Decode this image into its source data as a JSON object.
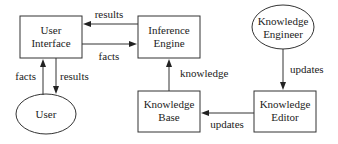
{
  "diagram": {
    "type": "flowchart",
    "nodes": {
      "user_interface": {
        "label_line1": "User",
        "label_line2": "Interface",
        "shape": "rectangle"
      },
      "inference_engine": {
        "label_line1": "Inference",
        "label_line2": "Engine",
        "shape": "rectangle"
      },
      "knowledge_engineer": {
        "label_line1": "Knowledge",
        "label_line2": "Engineer",
        "shape": "ellipse"
      },
      "user": {
        "label": "User",
        "shape": "ellipse"
      },
      "knowledge_base": {
        "label_line1": "Knowledge",
        "label_line2": "Base",
        "shape": "rectangle"
      },
      "knowledge_editor": {
        "label_line1": "Knowledge",
        "label_line2": "Editor",
        "shape": "rectangle"
      }
    },
    "edges": {
      "ie_to_ui": {
        "from": "Inference Engine",
        "to": "User Interface",
        "label": "results"
      },
      "ui_to_ie": {
        "from": "User Interface",
        "to": "Inference Engine",
        "label": "facts"
      },
      "user_to_ui": {
        "from": "User",
        "to": "User Interface",
        "label": "facts"
      },
      "ui_to_user": {
        "from": "User Interface",
        "to": "User",
        "label": "results"
      },
      "kb_to_ie": {
        "from": "Knowledge Base",
        "to": "Inference Engine",
        "label": "knowledge"
      },
      "ke_to_editor": {
        "from": "Knowledge Engineer",
        "to": "Knowledge Editor",
        "label": "updates"
      },
      "editor_to_kb": {
        "from": "Knowledge Editor",
        "to": "Knowledge Base",
        "label": "updates"
      }
    }
  }
}
